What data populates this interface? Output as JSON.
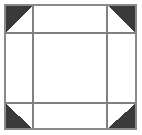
{
  "figure": {
    "canvas": {
      "width": 142,
      "height": 135,
      "background_color": "#ffffff"
    },
    "outer_border": {
      "name": "outer-square-border",
      "x": 5,
      "y": 5,
      "width": 131,
      "height": 124,
      "stroke_color": "#8a8a8a",
      "stroke_width": 2,
      "fill_color": "#ffffff"
    },
    "grid": {
      "rows": 3,
      "columns": 3,
      "line_color": "#808080",
      "line_width": 2,
      "vertical_lines": [
        33,
        107
      ],
      "horizontal_lines": [
        33,
        103
      ]
    },
    "corner_triangles": {
      "fill_color": "#3a3a3a",
      "count": 4,
      "items": [
        {
          "label": "top-left",
          "points": "5,5 33,5 5,33"
        },
        {
          "label": "top-right",
          "points": "136,5 136,33 107,5"
        },
        {
          "label": "bottom-left",
          "points": "5,129 5,103 33,129"
        },
        {
          "label": "bottom-right",
          "points": "136,129 107,129 136,103"
        }
      ]
    }
  }
}
